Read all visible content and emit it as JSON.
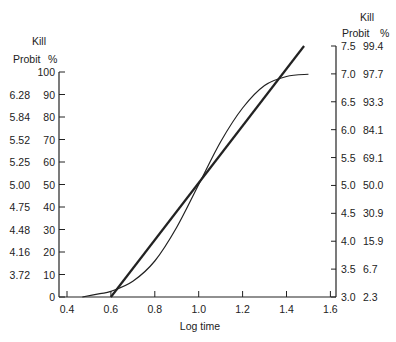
{
  "chart_data": {
    "type": "line",
    "title": "",
    "xlabel": "Log time",
    "ylabel_left": {
      "line1": "Kill",
      "line2_probit": "Probit",
      "line2_pct": "%"
    },
    "ylabel_right": {
      "line1": "Kill",
      "line2_probit": "Probit",
      "line2_pct": "%"
    },
    "xlim": [
      0.4,
      1.6
    ],
    "ylim_left_percent": [
      0,
      100
    ],
    "ylim_right_probit": [
      3.0,
      7.5
    ],
    "grid": false,
    "x_ticks": [
      "0.4",
      "0.6",
      "0.8",
      "1.0",
      "1.2",
      "1.4",
      "1.6"
    ],
    "left_axis": {
      "percent_ticks": [
        "0",
        "10",
        "20",
        "30",
        "40",
        "50",
        "60",
        "70",
        "80",
        "90",
        "100"
      ],
      "probit_labels": [
        "",
        "3.72",
        "4.16",
        "4.48",
        "4.75",
        "5.00",
        "5.25",
        "5.52",
        "5.84",
        "6.28",
        ""
      ]
    },
    "right_axis": {
      "probit_ticks": [
        "3.0",
        "3.5",
        "4.0",
        "4.5",
        "5.0",
        "5.5",
        "6.0",
        "6.5",
        "7.0",
        "7.5"
      ],
      "percent_labels": [
        "2.3",
        "6.7",
        "15.9",
        "30.9",
        "50.0",
        "69.1",
        "84.1",
        "93.3",
        "97.7",
        "99.4"
      ]
    },
    "series": [
      {
        "name": "Sigmoid kill % curve (left % axis)",
        "style": "thin",
        "x": [
          0.47,
          0.55,
          0.6,
          0.7,
          0.8,
          0.9,
          1.0,
          1.1,
          1.2,
          1.3,
          1.4,
          1.5
        ],
        "y_percent": [
          0,
          1.5,
          2.5,
          7,
          16,
          31,
          50,
          69,
          84,
          94,
          98,
          99
        ]
      },
      {
        "name": "Probit regression line (right probit axis)",
        "style": "thick",
        "x": [
          0.6,
          1.0,
          1.48
        ],
        "y_probit": [
          3.0,
          5.0,
          7.5
        ]
      }
    ]
  }
}
